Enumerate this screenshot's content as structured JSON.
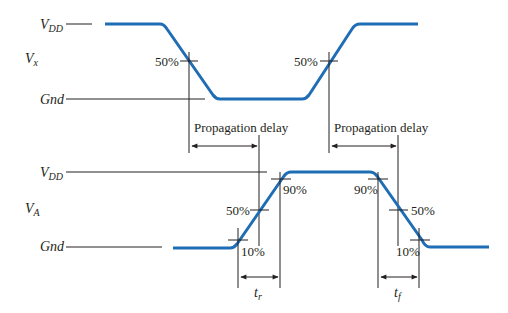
{
  "diagram": {
    "colors": {
      "waveform": "#1f6db5",
      "lines": "#231f20",
      "background": "#ffffff"
    },
    "top_signal": {
      "name_main": "V",
      "name_sub": "x",
      "vdd_main": "V",
      "vdd_sub": "DD",
      "gnd_label": "Gnd",
      "falling_edge_marker": "50%",
      "rising_edge_marker": "50%"
    },
    "delays": {
      "left_label": "Propagation delay",
      "right_label": "Propagation delay"
    },
    "bottom_signal": {
      "name_main": "V",
      "name_sub": "A",
      "vdd_main": "V",
      "vdd_sub": "DD",
      "gnd_label": "Gnd",
      "rise_10": "10%",
      "rise_50": "50%",
      "rise_90": "90%",
      "fall_90": "90%",
      "fall_50": "50%",
      "fall_10": "10%",
      "rise_time_main": "t",
      "rise_time_sub": "r",
      "fall_time_main": "t",
      "fall_time_sub": "f"
    }
  }
}
